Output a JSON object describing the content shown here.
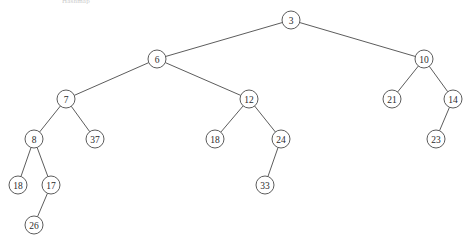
{
  "caption": "Hashmap",
  "diagram": {
    "type": "binary-search-tree",
    "width": 469,
    "height": 244,
    "node_radius": 9,
    "stroke_color": "#4a4a4a",
    "fill_color": "#ffffff",
    "text_color": "#2b2b2b",
    "nodes": [
      {
        "id": "n3",
        "label": "3",
        "x": 291,
        "y": 20,
        "depth": 0
      },
      {
        "id": "n6",
        "label": "6",
        "x": 157,
        "y": 59,
        "depth": 1
      },
      {
        "id": "n10",
        "label": "10",
        "x": 424,
        "y": 59,
        "depth": 1
      },
      {
        "id": "n7",
        "label": "7",
        "x": 66,
        "y": 99,
        "depth": 2
      },
      {
        "id": "n12",
        "label": "12",
        "x": 249,
        "y": 99,
        "depth": 2
      },
      {
        "id": "n21",
        "label": "21",
        "x": 392,
        "y": 99,
        "depth": 2
      },
      {
        "id": "n14",
        "label": "14",
        "x": 453,
        "y": 99,
        "depth": 2
      },
      {
        "id": "n8",
        "label": "8",
        "x": 34,
        "y": 139,
        "depth": 3
      },
      {
        "id": "n37",
        "label": "37",
        "x": 95,
        "y": 139,
        "depth": 3
      },
      {
        "id": "n18b",
        "label": "18",
        "x": 215,
        "y": 139,
        "depth": 3
      },
      {
        "id": "n24",
        "label": "24",
        "x": 281,
        "y": 139,
        "depth": 3
      },
      {
        "id": "n23",
        "label": "23",
        "x": 436,
        "y": 139,
        "depth": 3
      },
      {
        "id": "n18a",
        "label": "18",
        "x": 18,
        "y": 185,
        "depth": 4
      },
      {
        "id": "n17",
        "label": "17",
        "x": 51,
        "y": 185,
        "depth": 4
      },
      {
        "id": "n33",
        "label": "33",
        "x": 265,
        "y": 185,
        "depth": 4
      },
      {
        "id": "n26",
        "label": "26",
        "x": 34,
        "y": 225,
        "depth": 5
      }
    ],
    "edges": [
      {
        "from": "n3",
        "to": "n6",
        "side": "left"
      },
      {
        "from": "n3",
        "to": "n10",
        "side": "right"
      },
      {
        "from": "n6",
        "to": "n7",
        "side": "left"
      },
      {
        "from": "n6",
        "to": "n12",
        "side": "right"
      },
      {
        "from": "n10",
        "to": "n21",
        "side": "left"
      },
      {
        "from": "n10",
        "to": "n14",
        "side": "right"
      },
      {
        "from": "n7",
        "to": "n8",
        "side": "left"
      },
      {
        "from": "n7",
        "to": "n37",
        "side": "right"
      },
      {
        "from": "n12",
        "to": "n18b",
        "side": "left"
      },
      {
        "from": "n12",
        "to": "n24",
        "side": "right"
      },
      {
        "from": "n14",
        "to": "n23",
        "side": "left"
      },
      {
        "from": "n8",
        "to": "n18a",
        "side": "left"
      },
      {
        "from": "n8",
        "to": "n17",
        "side": "right"
      },
      {
        "from": "n24",
        "to": "n33",
        "side": "left"
      },
      {
        "from": "n17",
        "to": "n26",
        "side": "left"
      }
    ]
  }
}
